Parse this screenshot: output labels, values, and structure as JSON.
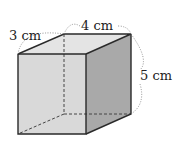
{
  "figure": {
    "type": "rectangular-prism",
    "labels": {
      "depth": "3 cm",
      "width": "4 cm",
      "height": "5 cm"
    },
    "colors": {
      "front_face": "#d9d9d9",
      "side_face": "#a9a9a9",
      "top_face": "#e4e4e4",
      "edge": "#2a2a2a",
      "dashed": "#444444"
    }
  }
}
